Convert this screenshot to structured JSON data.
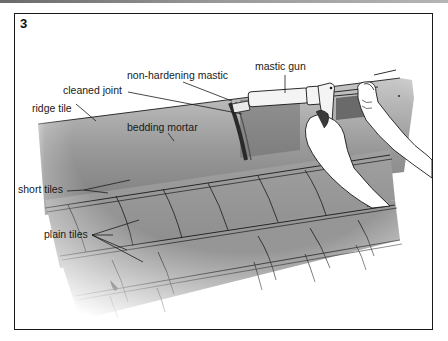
{
  "figure": {
    "step_number": "3"
  },
  "labels": {
    "mastic_gun": "mastic gun",
    "non_hardening_mastic": "non-hardening mastic",
    "cleaned_joint": "cleaned joint",
    "ridge_tile": "ridge tile",
    "bedding_mortar": "bedding mortar",
    "short_tiles": "short tiles",
    "plain_tiles": "plain tiles"
  },
  "colors": {
    "frame": "#1a1a1a",
    "tile_gray": "#8c8c8c",
    "tile_light": "#b4b4b4",
    "line": "#1a1a1a",
    "gun_body": "#f2f2f2"
  }
}
